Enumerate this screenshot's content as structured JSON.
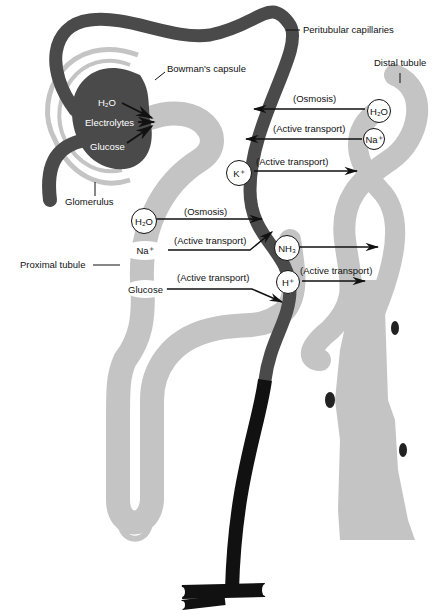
{
  "diagram": {
    "colors": {
      "capillary": "#4a4a4a",
      "vein": "#111111",
      "tubule": "#c4c4c4",
      "background": "#ffffff"
    },
    "structures": {
      "peritubular_capillaries": "Peritubular capillaries",
      "bowmans_capsule": "Bowman's capsule",
      "distal_tubule": "Distal tubule",
      "glomerulus": "Glomerulus",
      "proximal_tubule": "Proximal tubule"
    },
    "glomerulus_filtrates": [
      "H₂O",
      "Electrolytes",
      "Glucose"
    ],
    "substances": {
      "distal_h2o": "H₂O",
      "distal_na": "Na⁺",
      "k": "K⁺",
      "proximal_h2o": "H₂O",
      "proximal_na": "Na⁺",
      "proximal_glucose": "Glucose",
      "nh3": "NH₃",
      "h": "H⁺"
    },
    "processes": {
      "distal_h2o": "(Osmosis)",
      "distal_na": "(Active transport)",
      "k": "(Active transport)",
      "proximal_h2o": "(Osmosis)",
      "proximal_na": "(Active transport)",
      "proximal_glucose": "(Active transport)",
      "h": "(Active transport)"
    }
  }
}
